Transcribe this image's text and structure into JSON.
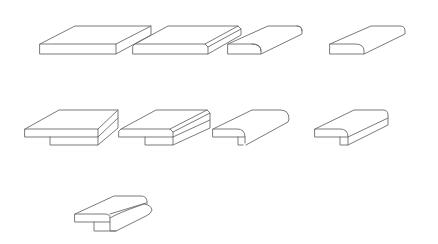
{
  "diagram": {
    "kind": "countertop-edge-profiles",
    "background": "#ffffff",
    "stroke_color": "#6b6b6b",
    "profiles": [
      {
        "id": "square-edge",
        "row": 1,
        "col": 1,
        "paths": [
          "M40,44 L116,44 L116,54 L40,54 Z",
          "M40,44 L75,26 L151,26 L116,44",
          "M151,26 L151,35 L116,54"
        ]
      },
      {
        "id": "bevel-edge",
        "row": 1,
        "col": 2,
        "paths": [
          "M133,46 L135,44 L205,44 L208,47 L208,54 L133,54 Z",
          "M135,44 L168,26 L238,26",
          "M205,44 L238,26 L241,29 L208,47",
          "M241,29 L241,35 L208,54"
        ]
      },
      {
        "id": "half-bullnose",
        "row": 1,
        "col": 3,
        "paths": [
          "M228,44 L252,44 Q261,44 261,51 L261,54 L228,54 Z",
          "M228,44 L268,26 L297,26 Q302,26 302,31 L302,34 L261,54",
          "M297,26 Q302,26 302,31",
          "M252,44 Q261,44 261,51"
        ]
      },
      {
        "id": "full-bullnose-round",
        "row": 1,
        "col": 4,
        "paths": [
          "M330,44 L355,44 Q364,44 364,51 L364,54 L330,54 Z",
          "M330,44 L371,26 L400,26 Q405,26 405,31 L405,34 L364,54"
        ]
      },
      {
        "id": "mitered-square-apron",
        "row": 2,
        "col": 1,
        "paths": [
          "M25,129 L98,129 L98,137 L25,137 Z",
          "M25,129 L59,110 L118,110 L98,129",
          "M118,110 L118,128 L98,145",
          "M98,137 L118,118",
          "M50,137 L50,145 L98,145 L98,137"
        ]
      },
      {
        "id": "mitered-bevel-apron",
        "row": 2,
        "col": 2,
        "paths": [
          "M119,131 L121,129 L170,129 L173,132 L173,137 L119,137 Z",
          "M121,129 L156,110 L207,110 L210,113",
          "M170,129 L207,110",
          "M173,132 L210,113 L210,128 L173,145",
          "M173,137 L210,120",
          "M145,137 L145,145 L173,145 L173,137"
        ]
      },
      {
        "id": "mitered-bullnose-apron",
        "row": 2,
        "col": 3,
        "paths": [
          "M213,129 L237,129 Q245,129 245,137 L238,137 L213,137 Z",
          "M213,129 L252,110 L280,110 Q289,110 289,119 L288,122 L246,145",
          "M238,137 L238,145 L243,145",
          "M245,137 L245,143"
        ]
      },
      {
        "id": "mitered-half-bullnose-apron",
        "row": 2,
        "col": 4,
        "paths": [
          "M315,129 L340,129 Q348,129 348,137 L315,137 Z",
          "M315,129 L354,110 L383,110 Q388,110 388,115 L388,125 L348,145",
          "M348,137 L388,118",
          "M340,137 L340,145 L348,145 L348,137"
        ]
      },
      {
        "id": "ogee-stepped-laminate",
        "row": 3,
        "col": 1,
        "paths": [
          "M75,214 L105,214 Q110,214 110,218 L110,222 L75,222 Z",
          "M75,214 L114,196 L141,196 Q147,196 147,202 L147,204",
          "M110,214 L146,203",
          "M110,218 Q118,213 144,204 Q151,205 152,210 Q151,214 146,216 L116,231 L94,231 L94,222",
          "M110,222 L110,231 L116,231"
        ]
      }
    ]
  }
}
